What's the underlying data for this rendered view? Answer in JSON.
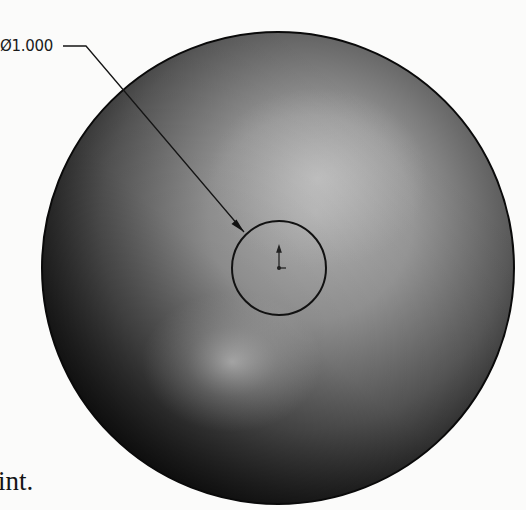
{
  "diagram": {
    "type": "CAD sketch on spherical face",
    "dimension": {
      "symbol": "Ø",
      "value": "1.000",
      "label": "Ø1.000",
      "target": "sketch-circle"
    },
    "body_text_fragment": "int.",
    "sphere": {
      "center": [
        278,
        268
      ],
      "radius": 236,
      "colors": {
        "highlight": "#d8d8d8",
        "mid": "#8f8f8f",
        "edge": "#151515",
        "outline": "#0a0a0a"
      }
    },
    "sketch_circle": {
      "center": [
        279,
        268
      ],
      "radius": 47,
      "stroke": "#111111"
    },
    "origin_marker": {
      "position": [
        279,
        268
      ]
    },
    "leader": {
      "shelf_start": [
        63,
        46
      ],
      "shelf_end": [
        86,
        46
      ],
      "arrow_tip": [
        244,
        232
      ]
    }
  }
}
